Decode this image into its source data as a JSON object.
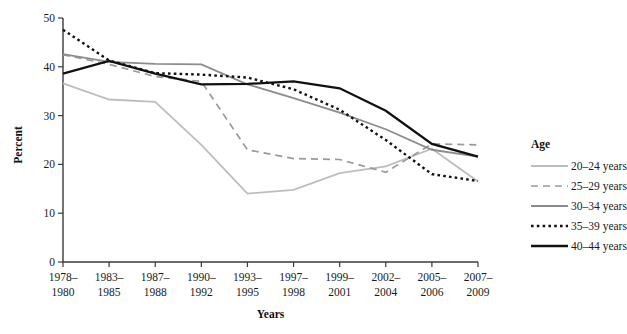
{
  "chart_data": {
    "type": "line",
    "title": "",
    "xlabel": "Years",
    "ylabel": "Percent",
    "ylim": [
      0,
      50
    ],
    "yticks": [
      0,
      10,
      20,
      30,
      40,
      50
    ],
    "grid": false,
    "legend_position": "right",
    "legend_title": "Age",
    "categories": [
      "1978–\n1980",
      "1983–\n1985",
      "1987–\n1988",
      "1990–\n1992",
      "1993–\n1995",
      "1997–\n1998",
      "1999–\n2001",
      "2002–\n2004",
      "2005–\n2006",
      "2007–\n2009"
    ],
    "category_lines": [
      [
        "1978–",
        "1980"
      ],
      [
        "1983–",
        "1985"
      ],
      [
        "1987–",
        "1988"
      ],
      [
        "1990–",
        "1992"
      ],
      [
        "1993–",
        "1995"
      ],
      [
        "1997–",
        "1998"
      ],
      [
        "1999–",
        "2001"
      ],
      [
        "2002–",
        "2004"
      ],
      [
        "2005–",
        "2006"
      ],
      [
        "2007–",
        "2009"
      ]
    ],
    "series": [
      {
        "name": "20–24 years",
        "style": "solid",
        "color": "#bdbdbd",
        "width": 1.8,
        "dash": "",
        "values": [
          36.6,
          33.3,
          32.8,
          24.0,
          14.0,
          14.8,
          18.2,
          19.6,
          23.2,
          16.5
        ]
      },
      {
        "name": "25–29 years",
        "style": "dashed",
        "color": "#9a9a9a",
        "width": 1.7,
        "dash": "7,5",
        "values": [
          42.5,
          40.5,
          38.0,
          37.0,
          23.0,
          21.2,
          21.0,
          18.4,
          24.2,
          24.0
        ]
      },
      {
        "name": "30–34 years",
        "style": "solid",
        "color": "#8c8c8c",
        "width": 1.8,
        "dash": "",
        "values": [
          42.6,
          41.0,
          40.6,
          40.5,
          36.4,
          33.6,
          30.6,
          27.2,
          23.0,
          21.6
        ]
      },
      {
        "name": "35–39 years",
        "style": "dotted",
        "color": "#111111",
        "width": 2.4,
        "dash": "2.6,3.2",
        "values": [
          47.6,
          41.3,
          38.7,
          38.4,
          37.8,
          35.4,
          31.2,
          25.0,
          18.0,
          16.6
        ]
      },
      {
        "name": "40–44 years",
        "style": "solid",
        "color": "#111111",
        "width": 2.3,
        "dash": "",
        "values": [
          38.6,
          41.2,
          38.6,
          36.4,
          36.5,
          37.0,
          35.6,
          31.0,
          24.2,
          21.6
        ]
      }
    ]
  },
  "legend": {
    "title": "Age",
    "items": [
      {
        "label": "20–24 years"
      },
      {
        "label": "25–29 years"
      },
      {
        "label": "30–34 years"
      },
      {
        "label": "35–39 years"
      },
      {
        "label": "40–44 years"
      }
    ]
  },
  "axes": {
    "y_title": "Percent",
    "x_title": "Years",
    "y_tick_labels": [
      "0",
      "10",
      "20",
      "30",
      "40",
      "50"
    ]
  }
}
